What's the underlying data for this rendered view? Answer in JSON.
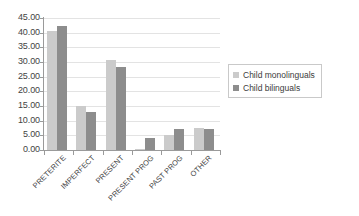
{
  "chart_data": {
    "type": "bar",
    "title": "",
    "subtitle": "",
    "xlabel": "",
    "ylabel": "",
    "categories": [
      "PRETERITE",
      "IMPERFECT",
      "PRESENT",
      "PRESENT PROG",
      "PAST PROG",
      "OTHER"
    ],
    "series": [
      {
        "name": "Child monolinguals",
        "color": "#cbcbcb",
        "values": [
          40.5,
          15.0,
          30.7,
          0.5,
          5.0,
          7.5
        ]
      },
      {
        "name": "Child bilinguals",
        "color": "#8d8d8d",
        "values": [
          42.3,
          13.0,
          28.3,
          4.0,
          7.0,
          7.0
        ]
      }
    ],
    "ylim": [
      0,
      45
    ],
    "ytick_step": 5,
    "ytick_labels": [
      "45.00",
      "40.00",
      "35.00",
      "30.00",
      "25.00",
      "20.00",
      "15.00",
      "10.00",
      "5.00",
      "0.00"
    ],
    "ytick_values": [
      45,
      40,
      35,
      30,
      25,
      20,
      15,
      10,
      5,
      0
    ],
    "grid": true,
    "grid_axis": "y",
    "legend_position": "right",
    "legend": [
      {
        "label": "Child monolinguals",
        "color": "#cbcbcb"
      },
      {
        "label": "Child bilinguals",
        "color": "#8d8d8d"
      }
    ]
  },
  "colors": {
    "background": "#ffffff",
    "axis": "#9a9a9a",
    "gridline": "#e3e3e3",
    "text": "#434343",
    "series_monolinguals": "#cbcbcb",
    "series_bilinguals": "#8d8d8d"
  }
}
